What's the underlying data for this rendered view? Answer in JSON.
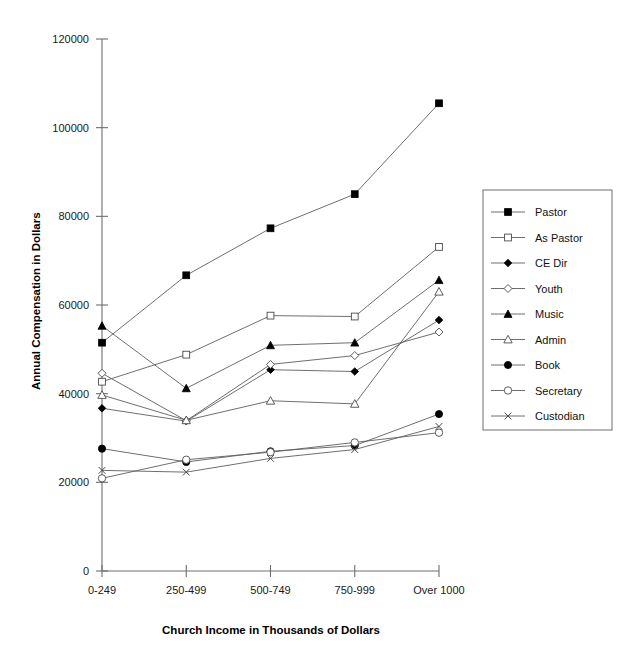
{
  "chart_data": {
    "type": "line",
    "title": "",
    "xlabel": "Church Income in Thousands of Dollars",
    "ylabel": "Annual Compensation in Dollars",
    "categories": [
      "0-249",
      "250-499",
      "500-749",
      "750-999",
      "Over 1000"
    ],
    "ylim": [
      0,
      120000
    ],
    "ytick_labels": [
      "0",
      "20000",
      "40000",
      "60000",
      "80000",
      "100000",
      "120000"
    ],
    "yticks": [
      0,
      20000,
      40000,
      60000,
      80000,
      100000,
      120000
    ],
    "grid": false,
    "legend_position": "right",
    "series": [
      {
        "name": "Pastor",
        "marker": "filled-square",
        "values": [
          51500,
          66700,
          77300,
          85000,
          105500
        ]
      },
      {
        "name": "As Pastor",
        "marker": "open-square",
        "values": [
          42700,
          48800,
          57600,
          57400,
          73100
        ]
      },
      {
        "name": "CE Dir",
        "marker": "filled-diamond",
        "values": [
          36700,
          33800,
          45400,
          45000,
          56600
        ]
      },
      {
        "name": "Youth",
        "marker": "open-diamond",
        "values": [
          44600,
          33900,
          46600,
          48600,
          53900
        ]
      },
      {
        "name": "Music",
        "marker": "filled-triangle",
        "values": [
          55300,
          41200,
          50900,
          51500,
          65600
        ]
      },
      {
        "name": "Admin",
        "marker": "open-triangle",
        "values": [
          39700,
          34000,
          38400,
          37700,
          63000
        ]
      },
      {
        "name": "Book",
        "marker": "filled-circle",
        "values": [
          27600,
          24600,
          27000,
          28300,
          35400
        ]
      },
      {
        "name": "Secretary",
        "marker": "open-circle",
        "values": [
          20900,
          25100,
          26800,
          29000,
          31200
        ]
      },
      {
        "name": "Custodian",
        "marker": "cross",
        "values": [
          22700,
          22300,
          25400,
          27400,
          32600
        ]
      }
    ]
  }
}
